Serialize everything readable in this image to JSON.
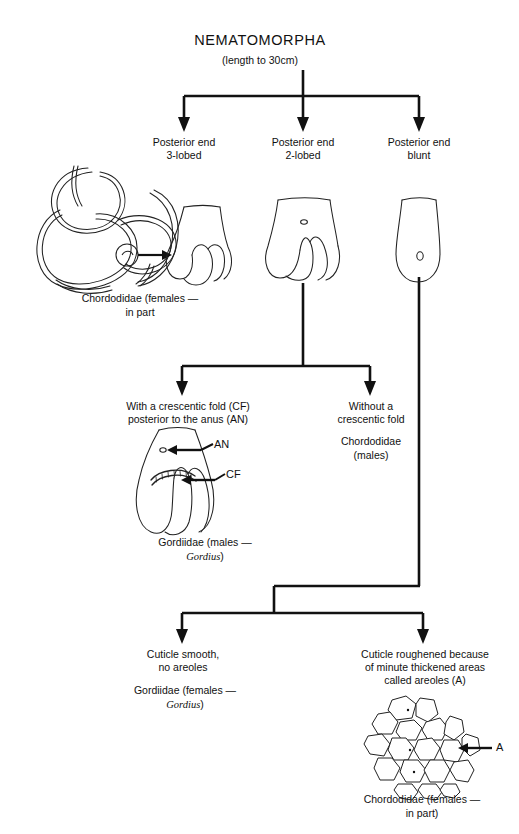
{
  "figure": {
    "title": "NEMATOMORPHA",
    "subtitle": "(length to 30cm)"
  },
  "level1": {
    "branches": [
      {
        "label": "Posterior end\n3-lobed",
        "icon": "posterior-end-3-lobed-diagram"
      },
      {
        "label": "Posterior end\n2-lobed",
        "icon": "posterior-end-2-lobed-diagram"
      },
      {
        "label": "Posterior end\nblunt",
        "icon": "posterior-end-blunt-diagram"
      }
    ],
    "worm_caption": "Chordodidae (females —\nin part"
  },
  "level2": {
    "left_label": "With a crescentic fold (CF)\nposterior to the anus (AN)",
    "right_label": "Without a\ncrescentic fold",
    "right_taxon": "Chordodidae\n(males)",
    "annotations": {
      "anus": "AN",
      "crescentic_fold": "CF"
    },
    "left_taxon_line1": "Gordiidae (males —",
    "left_taxon_genus": "Gordius",
    "left_taxon_close": ")"
  },
  "level3": {
    "left_label": "Cuticle smooth,\nno areoles",
    "left_taxon_line1": "Gordiidae (females —",
    "left_taxon_genus": "Gordius",
    "left_taxon_close": ")",
    "right_label": "Cuticle roughened because\nof minute thickened areas\ncalled areoles (A)",
    "right_annotation": "A",
    "right_taxon": "Chordodidae (females —\nin part)"
  },
  "colors": {
    "ink": "#111111",
    "background": "#ffffff"
  }
}
